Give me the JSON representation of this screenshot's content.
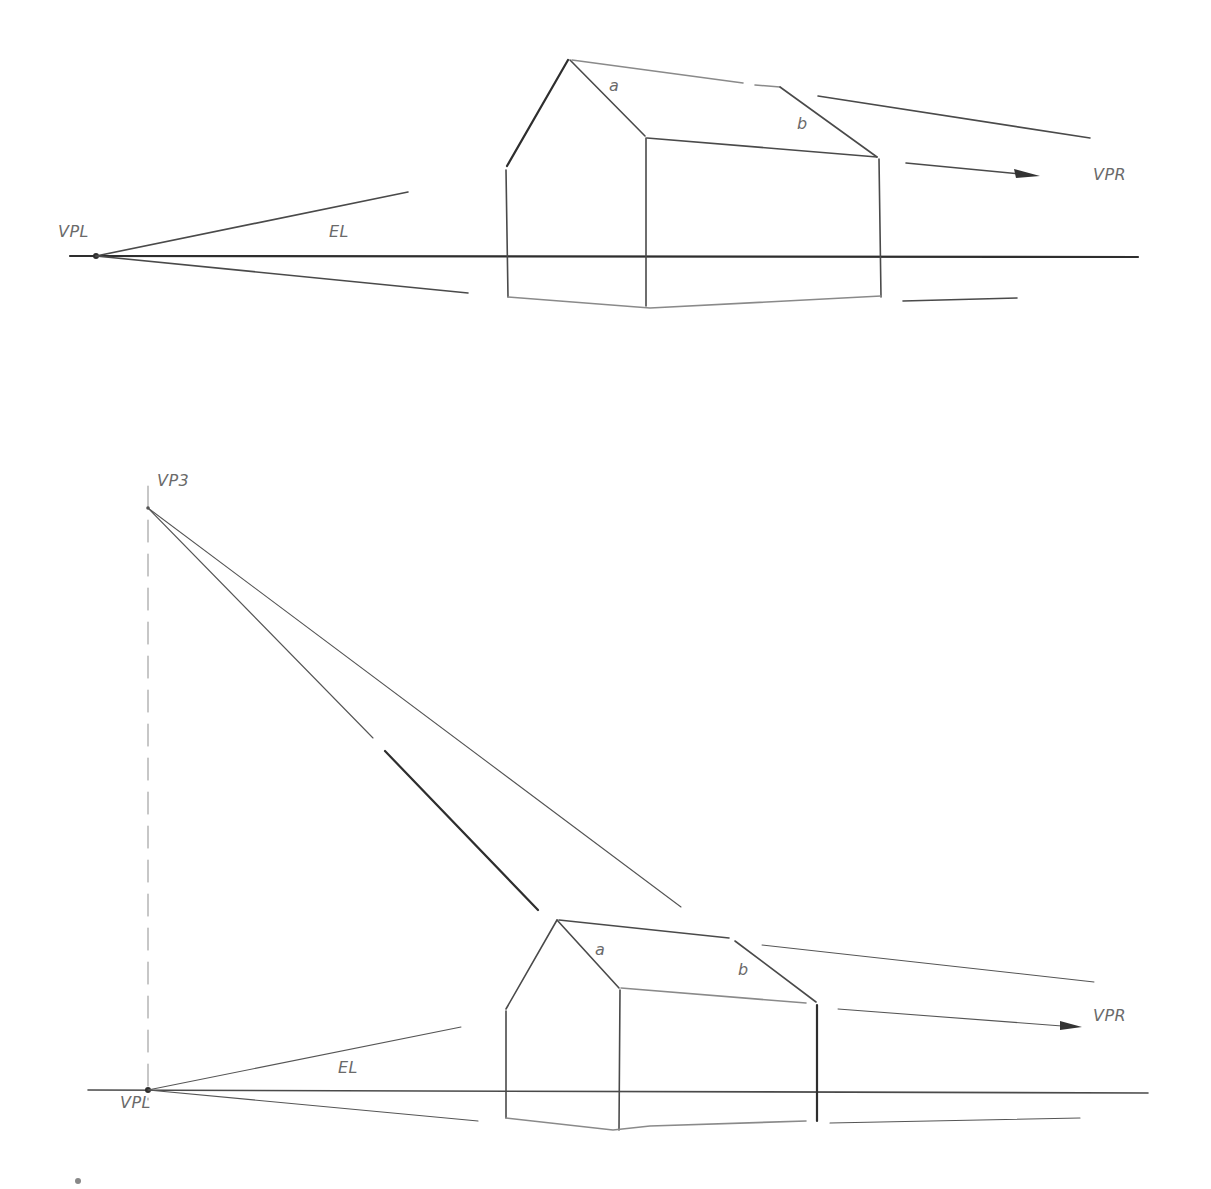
{
  "colors": {
    "background": "#ffffff",
    "pencil": "#4a4a4a",
    "label": "#6a6a6a"
  },
  "diagrams": [
    {
      "id": "two-point-perspective",
      "labels": {
        "vanishing_point_left": "VPL",
        "vanishing_point_right": "VPR",
        "eye_level": "EL",
        "edge_a": "a",
        "edge_b": "b"
      }
    },
    {
      "id": "three-point-perspective",
      "labels": {
        "vanishing_point_3": "VP3",
        "vanishing_point_left": "VPL",
        "vanishing_point_right": "VPR",
        "eye_level": "EL",
        "edge_a": "a",
        "edge_b": "b"
      }
    }
  ]
}
